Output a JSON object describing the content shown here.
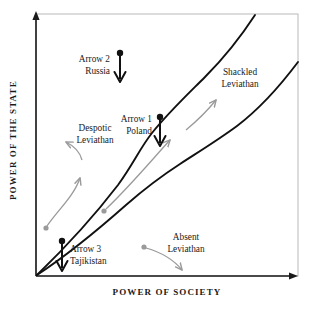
{
  "figure": {
    "axes": {
      "x_label": "POWER OF SOCIETY",
      "y_label": "POWER OF THE STATE"
    },
    "regions": [
      {
        "id": "despotic",
        "line1": "Despotic",
        "line2": "Leviathan"
      },
      {
        "id": "shackled",
        "line1": "Shackled",
        "line2": "Leviathan"
      },
      {
        "id": "absent",
        "line1": "Absent",
        "line2": "Leviathan"
      }
    ],
    "annotations": [
      {
        "id": "arrow-2",
        "line1": "Arrow 2",
        "line2": "Russia"
      },
      {
        "id": "arrow-1",
        "line1": "Arrow 1",
        "line2": "Poland"
      },
      {
        "id": "arrow-3",
        "line1": "Arrow 3",
        "line2": "Tajikistan"
      }
    ],
    "colors": {
      "curve": "#111111",
      "axis": "#1a1a1a",
      "frame": "#b9b9b9",
      "pointer": "#9a9a9a",
      "marker": "#1a1a1a",
      "background": "#ffffff"
    }
  }
}
